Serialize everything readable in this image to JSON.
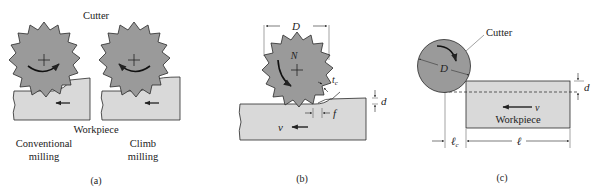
{
  "colors": {
    "cutter_fill": "#9a9a9a",
    "workpiece_fill": "#d9d9d9",
    "outline": "#2a2a2a",
    "background": "#ffffff"
  },
  "panel_a": {
    "caption": "(a)",
    "cutter_label": "Cutter",
    "workpiece_label": "Workpiece",
    "left_mode_line1": "Conventional",
    "left_mode_line2": "milling",
    "right_mode_line1": "Climb",
    "right_mode_line2": "milling"
  },
  "panel_b": {
    "caption": "(b)",
    "diameter_label": "D",
    "rotation_label": "N",
    "chip_thickness_label": "t",
    "chip_thickness_sub": "c",
    "depth_label": "d",
    "feed_label": "f",
    "velocity_label": "v"
  },
  "panel_c": {
    "caption": "(c)",
    "cutter_label": "Cutter",
    "diameter_label": "D",
    "depth_label": "d",
    "velocity_label": "v",
    "workpiece_label": "Workpiece",
    "approach_length_label": "ℓ",
    "approach_length_sub": "c",
    "length_label": "ℓ"
  }
}
